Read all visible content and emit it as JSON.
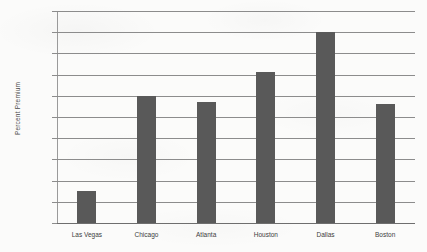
{
  "chart_data": {
    "type": "bar",
    "title": "",
    "subtitle": "",
    "xlabel": "",
    "ylabel": "Percent Premium",
    "categories": [
      "Las Vegas",
      "Chicago",
      "Atlanta",
      "Houston",
      "Dallas",
      "Boston"
    ],
    "values": [
      0.75,
      3.0,
      2.85,
      3.55,
      4.5,
      2.8
    ],
    "ylim": [
      0,
      5
    ],
    "ytick_step": 0.5,
    "ytick_labels": [
      "0",
      "0.5",
      "1",
      "1.5",
      "2",
      "2.5",
      "3",
      "3.5",
      "4",
      "4.5",
      "5"
    ],
    "grid": true,
    "grid_axis": "y",
    "legend": false,
    "legend_position": "none",
    "series": [
      {
        "name": "Percent Premium",
        "values": [
          0.75,
          3.0,
          2.85,
          3.55,
          4.5,
          2.8
        ]
      }
    ]
  },
  "style": {
    "bar_color": "#595959",
    "grid_color": "#8c8c8c",
    "axis_color": "#9a9a9a",
    "text_color": "#3d3d3d",
    "background": "#fbfbfa"
  }
}
